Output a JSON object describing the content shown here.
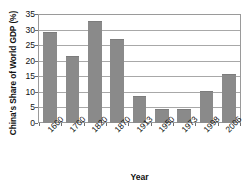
{
  "chart_data": {
    "type": "bar",
    "title": "",
    "xlabel": "Year",
    "ylabel": "China's Share of World GDP (%)",
    "categories": [
      "1600",
      "1700",
      "1820",
      "1870",
      "1913",
      "1950",
      "1973",
      "1998",
      "2006"
    ],
    "values": [
      29.4,
      21.8,
      32.9,
      27.3,
      8.8,
      4.6,
      4.5,
      10.4,
      15.8
    ],
    "ylim": [
      0,
      35
    ],
    "yticks": [
      0,
      5,
      10,
      15,
      20,
      25,
      30,
      35
    ],
    "ytick_labels": [
      "0",
      "5",
      "10",
      "15",
      "20",
      "25",
      "30",
      "35"
    ],
    "grid": "horizontal",
    "legend": "none",
    "bar_color": "#8a8a8a",
    "frame_color": "#9a9a9a",
    "gridline_color": "#a8a8a8",
    "background_color": "#ffffff"
  }
}
